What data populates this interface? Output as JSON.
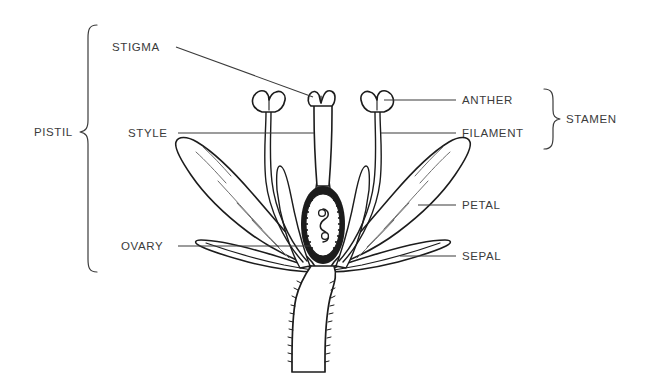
{
  "diagram": {
    "background_color": "#ffffff",
    "ink_color": "#1c1c1c",
    "text_color": "#3b3b3b"
  },
  "labels": {
    "stigma": "STIGMA",
    "style": "STYLE",
    "ovary": "OVARY",
    "anther": "ANTHER",
    "filament": "FILAMENT",
    "petal": "PETAL",
    "sepal": "SEPAL"
  },
  "group_labels": {
    "pistil": "PISTIL",
    "stamen": "STAMEN"
  }
}
